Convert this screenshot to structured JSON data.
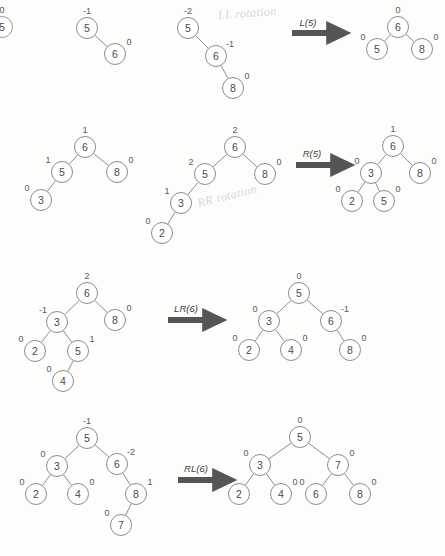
{
  "page": {
    "background_color": "#fdfdfc",
    "node_stroke_color": "#8d8d8d",
    "edge_color": "#8d8d8d",
    "arrow_color": "#555555",
    "text_color": "#4a4a4a",
    "pencil_color": "#d8d8d8"
  },
  "chart_data": {
    "type": "diagram",
    "rows": [
      {
        "id": "row-1",
        "operation": "L(5)",
        "handwriting": "LL rotation",
        "before": {
          "nodes": [
            {
              "key": "5",
              "bf": "-2",
              "x": 188,
              "y": 28
            },
            {
              "key": "6",
              "bf": "-1",
              "x": 216,
              "y": 56
            },
            {
              "key": "8",
              "bf": "0",
              "x": 233,
              "y": 88
            }
          ],
          "edges": [
            [
              0,
              1
            ],
            [
              1,
              2
            ]
          ]
        },
        "after": {
          "nodes": [
            {
              "key": "6",
              "bf": "0",
              "x": 398,
              "y": 27
            },
            {
              "key": "5",
              "bf": "0",
              "x": 377,
              "y": 49
            },
            {
              "key": "8",
              "bf": "0",
              "x": 422,
              "y": 49
            }
          ],
          "edges": [
            [
              0,
              1
            ],
            [
              0,
              2
            ]
          ]
        },
        "extra_trees": [
          {
            "id": "row-1-stage-0",
            "nodes": [
              {
                "key": "5",
                "bf": "0",
                "x": 2,
                "y": 27
              }
            ],
            "edges": []
          },
          {
            "id": "row-1-stage-1",
            "nodes": [
              {
                "key": "5",
                "bf": "-1",
                "x": 87,
                "y": 28
              },
              {
                "key": "6",
                "bf": "0",
                "x": 115,
                "y": 54
              }
            ],
            "edges": [
              [
                0,
                1
              ]
            ]
          }
        ]
      },
      {
        "id": "row-2",
        "operation": "R(5)",
        "handwriting": "RR rotation",
        "before": {
          "nodes": [
            {
              "key": "6",
              "bf": "2",
              "x": 235,
              "y": 147
            },
            {
              "key": "5",
              "bf": "2",
              "x": 205,
              "y": 174
            },
            {
              "key": "8",
              "bf": "0",
              "x": 265,
              "y": 174
            },
            {
              "key": "3",
              "bf": "1",
              "x": 181,
              "y": 203
            },
            {
              "key": "2",
              "bf": "0",
              "x": 162,
              "y": 233
            }
          ],
          "edges": [
            [
              0,
              1
            ],
            [
              0,
              2
            ],
            [
              1,
              3
            ],
            [
              3,
              4
            ]
          ]
        },
        "after": {
          "nodes": [
            {
              "key": "6",
              "bf": "1",
              "x": 393,
              "y": 146
            },
            {
              "key": "3",
              "bf": "0",
              "x": 371,
              "y": 173
            },
            {
              "key": "8",
              "bf": "0",
              "x": 420,
              "y": 173
            },
            {
              "key": "2",
              "bf": "0",
              "x": 352,
              "y": 201
            },
            {
              "key": "5",
              "bf": "0",
              "x": 384,
              "y": 201
            }
          ],
          "edges": [
            [
              0,
              1
            ],
            [
              0,
              2
            ],
            [
              1,
              3
            ],
            [
              1,
              4
            ]
          ]
        },
        "extra_trees": [
          {
            "id": "row-2-stage-0",
            "nodes": [
              {
                "key": "6",
                "bf": "1",
                "x": 85,
                "y": 147
              },
              {
                "key": "5",
                "bf": "1",
                "x": 62,
                "y": 172
              },
              {
                "key": "8",
                "bf": "0",
                "x": 117,
                "y": 172
              },
              {
                "key": "3",
                "bf": "0",
                "x": 41,
                "y": 200
              }
            ],
            "edges": [
              [
                0,
                1
              ],
              [
                0,
                2
              ],
              [
                1,
                3
              ]
            ]
          }
        ]
      },
      {
        "id": "row-3",
        "operation": "LR(6)",
        "handwriting": "",
        "before": {
          "nodes": [
            {
              "key": "6",
              "bf": "2",
              "x": 87,
              "y": 293
            },
            {
              "key": "3",
              "bf": "-1",
              "x": 57,
              "y": 322
            },
            {
              "key": "8",
              "bf": "0",
              "x": 115,
              "y": 320
            },
            {
              "key": "2",
              "bf": "0",
              "x": 35,
              "y": 351
            },
            {
              "key": "5",
              "bf": "1",
              "x": 78,
              "y": 351
            },
            {
              "key": "4",
              "bf": "0",
              "x": 63,
              "y": 381
            }
          ],
          "edges": [
            [
              0,
              1
            ],
            [
              0,
              2
            ],
            [
              1,
              3
            ],
            [
              1,
              4
            ],
            [
              4,
              5
            ]
          ]
        },
        "after": {
          "nodes": [
            {
              "key": "5",
              "bf": "0",
              "x": 299,
              "y": 293
            },
            {
              "key": "3",
              "bf": "0",
              "x": 269,
              "y": 321
            },
            {
              "key": "6",
              "bf": "-1",
              "x": 331,
              "y": 321
            },
            {
              "key": "2",
              "bf": "0",
              "x": 249,
              "y": 350
            },
            {
              "key": "4",
              "bf": "0",
              "x": 291,
              "y": 350
            },
            {
              "key": "8",
              "bf": "0",
              "x": 350,
              "y": 350
            }
          ],
          "edges": [
            [
              0,
              1
            ],
            [
              0,
              2
            ],
            [
              1,
              3
            ],
            [
              1,
              4
            ],
            [
              2,
              5
            ]
          ]
        },
        "extra_trees": []
      },
      {
        "id": "row-4",
        "operation": "RL(6)",
        "handwriting": "",
        "before": {
          "nodes": [
            {
              "key": "5",
              "bf": "-1",
              "x": 87,
              "y": 438
            },
            {
              "key": "3",
              "bf": "0",
              "x": 57,
              "y": 466
            },
            {
              "key": "6",
              "bf": "-2",
              "x": 117,
              "y": 464
            },
            {
              "key": "2",
              "bf": "0",
              "x": 36,
              "y": 494
            },
            {
              "key": "4",
              "bf": "0",
              "x": 78,
              "y": 494
            },
            {
              "key": "8",
              "bf": "1",
              "x": 136,
              "y": 494
            },
            {
              "key": "7",
              "bf": "0",
              "x": 121,
              "y": 525
            }
          ],
          "edges": [
            [
              0,
              1
            ],
            [
              0,
              2
            ],
            [
              1,
              3
            ],
            [
              1,
              4
            ],
            [
              2,
              5
            ],
            [
              5,
              6
            ]
          ]
        },
        "after": {
          "nodes": [
            {
              "key": "5",
              "bf": "0",
              "x": 300,
              "y": 437
            },
            {
              "key": "3",
              "bf": "0",
              "x": 260,
              "y": 465
            },
            {
              "key": "7",
              "bf": "0",
              "x": 338,
              "y": 465
            },
            {
              "key": "2",
              "bf": "0",
              "x": 239,
              "y": 494
            },
            {
              "key": "4",
              "bf": "0",
              "x": 281,
              "y": 494
            },
            {
              "key": "6",
              "bf": "0",
              "x": 316,
              "y": 494
            },
            {
              "key": "8",
              "bf": "0",
              "x": 360,
              "y": 494
            }
          ],
          "edges": [
            [
              0,
              1
            ],
            [
              0,
              2
            ],
            [
              1,
              3
            ],
            [
              1,
              4
            ],
            [
              2,
              5
            ],
            [
              2,
              6
            ]
          ]
        },
        "extra_trees": []
      }
    ],
    "arrows": [
      {
        "id": "arrow-l5",
        "label": "L(5)",
        "x1": 292,
        "y1": 33,
        "x2": 337,
        "y2": 33,
        "label_x": 308,
        "label_y": 22
      },
      {
        "id": "arrow-r5",
        "label": "R(5)",
        "x1": 296,
        "y1": 165,
        "x2": 341,
        "y2": 165,
        "label_x": 312,
        "label_y": 153
      },
      {
        "id": "arrow-lr6",
        "label": "LR(6)",
        "x1": 168,
        "y1": 320,
        "x2": 213,
        "y2": 320,
        "label_x": 186,
        "label_y": 308
      },
      {
        "id": "arrow-rl6",
        "label": "RL(6)",
        "x1": 178,
        "y1": 480,
        "x2": 223,
        "y2": 480,
        "label_x": 196,
        "label_y": 468
      }
    ],
    "pencil_notes": [
      {
        "id": "note-ll",
        "text": "LL rotation",
        "x": 218,
        "y": 8,
        "rotate": -4,
        "size": 12
      },
      {
        "id": "note-rr",
        "text": "RR rotation",
        "x": 198,
        "y": 196,
        "rotate": -14,
        "size": 12
      }
    ]
  }
}
